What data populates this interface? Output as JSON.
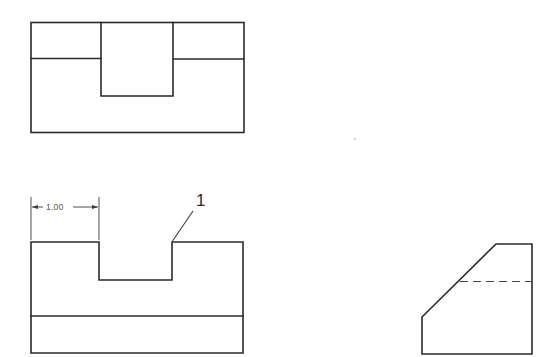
{
  "drawing": {
    "type": "orthographic projection",
    "views": [
      {
        "name": "top-view"
      },
      {
        "name": "front-view"
      },
      {
        "name": "right-side-view"
      }
    ],
    "dimension": {
      "value": "1.00"
    },
    "callout": {
      "label": "1"
    },
    "colors": {
      "line": "#2a2a2a",
      "background": "#ffffff"
    }
  }
}
